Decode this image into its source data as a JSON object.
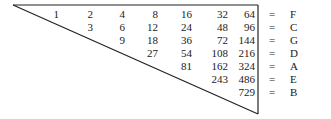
{
  "diagram": {
    "type": "multiplication-triangle",
    "rows": [
      {
        "values": [
          "1",
          "2",
          "4",
          "8",
          "16",
          "32",
          "64"
        ],
        "equals": "=",
        "label": "F"
      },
      {
        "values": [
          "3",
          "6",
          "12",
          "24",
          "48",
          "96"
        ],
        "equals": "=",
        "label": "C"
      },
      {
        "values": [
          "9",
          "18",
          "36",
          "72",
          "144"
        ],
        "equals": "=",
        "label": "G"
      },
      {
        "values": [
          "27",
          "54",
          "108",
          "216"
        ],
        "equals": "=",
        "label": "D"
      },
      {
        "values": [
          "81",
          "162",
          "324"
        ],
        "equals": "=",
        "label": "A"
      },
      {
        "values": [
          "243",
          "486"
        ],
        "equals": "=",
        "label": "E"
      },
      {
        "values": [
          "729"
        ],
        "equals": "=",
        "label": "B"
      }
    ],
    "line_color": "#222222",
    "text_color": "#1a1a1a"
  }
}
